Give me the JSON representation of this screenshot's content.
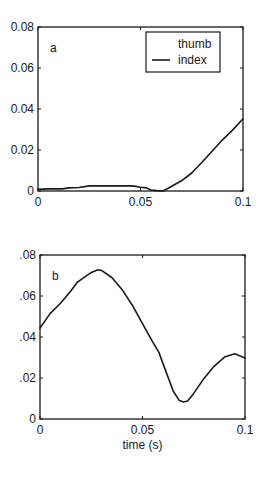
{
  "chart_data": [
    {
      "type": "line",
      "panel_label": "a",
      "title": "",
      "xlabel": "",
      "ylabel": "",
      "xlim": [
        0,
        0.1
      ],
      "ylim": [
        0,
        0.08
      ],
      "grid": false,
      "x_ticks": [
        0,
        0.05,
        0.1
      ],
      "x_tick_labels": [
        "0",
        "0.05",
        "0.1"
      ],
      "y_ticks": [
        0,
        0.02,
        0.04,
        0.06,
        0.08
      ],
      "y_tick_labels": [
        "0",
        "0.02",
        "0.04",
        "0.06",
        "0.08"
      ],
      "legend": {
        "position": "upper right",
        "entries": [
          "thumb",
          "index"
        ]
      },
      "series": [
        {
          "name": "index",
          "x": [
            0,
            0.005,
            0.012,
            0.015,
            0.02,
            0.025,
            0.03,
            0.035,
            0.04,
            0.045,
            0.047,
            0.05,
            0.053,
            0.055,
            0.058,
            0.061,
            0.065,
            0.07,
            0.075,
            0.08,
            0.085,
            0.09,
            0.095,
            0.1
          ],
          "values": [
            0.0008,
            0.001,
            0.001,
            0.0015,
            0.0017,
            0.0025,
            0.0025,
            0.0025,
            0.0025,
            0.0025,
            0.0024,
            0.0018,
            0.0015,
            0.0005,
            0.0002,
            0.0,
            0.0022,
            0.005,
            0.0088,
            0.014,
            0.0195,
            0.025,
            0.0298,
            0.0352
          ]
        }
      ]
    },
    {
      "type": "line",
      "panel_label": "b",
      "title": "",
      "xlabel": "time (s)",
      "ylabel": "",
      "xlim": [
        0,
        0.1
      ],
      "ylim": [
        0,
        0.08
      ],
      "grid": false,
      "x_ticks": [
        0,
        0.05,
        0.1
      ],
      "x_tick_labels": [
        "0",
        "0.05",
        "0.1"
      ],
      "y_ticks": [
        0,
        0.02,
        0.04,
        0.06,
        0.08
      ],
      "y_tick_labels": [
        "0",
        ".02",
        ".04",
        ".06",
        ".08"
      ],
      "series": [
        {
          "name": "",
          "x": [
            0,
            0.005,
            0.01,
            0.015,
            0.018,
            0.02,
            0.025,
            0.028,
            0.03,
            0.035,
            0.04,
            0.045,
            0.05,
            0.055,
            0.058,
            0.06,
            0.065,
            0.068,
            0.07,
            0.072,
            0.075,
            0.08,
            0.085,
            0.09,
            0.095,
            0.1
          ],
          "values": [
            0.0444,
            0.0515,
            0.0565,
            0.0625,
            0.0665,
            0.068,
            0.0715,
            0.0727,
            0.0725,
            0.069,
            0.0632,
            0.0555,
            0.0465,
            0.0375,
            0.0325,
            0.027,
            0.0135,
            0.009,
            0.0083,
            0.0088,
            0.0125,
            0.0198,
            0.0258,
            0.0302,
            0.0318,
            0.0298
          ]
        }
      ]
    }
  ]
}
